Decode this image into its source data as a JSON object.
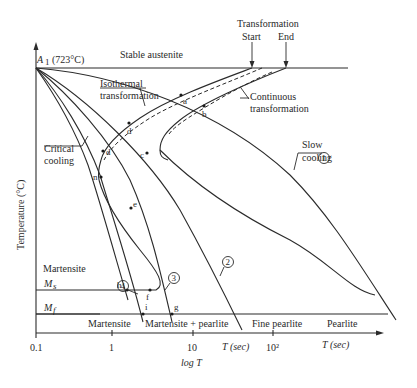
{
  "diagram": {
    "type": "CCT / TTT cooling transformation diagram",
    "header": {
      "transformation": "Transformation",
      "start": "Start",
      "end": "End"
    },
    "regions": {
      "stable_austenite": "Stable austenite",
      "martensite_upper": "Martensite"
    },
    "labels": {
      "a1": "A",
      "a1_sub": "1",
      "a1_temp": "(723°C)",
      "isothermal_1": "Isothermal",
      "isothermal_2": "transformation",
      "continuous_1": "Continuous",
      "continuous_2": "transformation",
      "critical_1": "Critical",
      "critical_2": "cooling",
      "slow_1": "Slow",
      "slow_2": "cooling",
      "ms": "M",
      "ms_sub": "s",
      "mf": "M",
      "mf_sub": "f"
    },
    "points": [
      "a",
      "b",
      "d",
      "d",
      "c",
      "n",
      "e",
      "h",
      "f",
      "i",
      "g"
    ],
    "curves": [
      {
        "id": "1",
        "name": "Slow cooling"
      },
      {
        "id": "2",
        "name": "Cooling curve 2"
      },
      {
        "id": "3",
        "name": "Cooling curve 3"
      },
      {
        "id": "4",
        "name": "Cooling curve 4"
      }
    ],
    "products": [
      "Martensite",
      "Martensite + pearlite",
      "Fine pearlite",
      "Pearlite"
    ],
    "axes": {
      "y_label": "Temperature (°C)",
      "x_ticks": [
        "0.1",
        "1",
        "10",
        "10²"
      ],
      "x_label": "log T",
      "t_sec_1": "T (sec)",
      "t_sec_2": "T (sec)"
    }
  }
}
